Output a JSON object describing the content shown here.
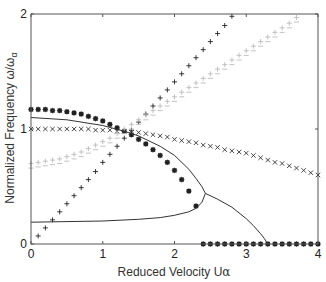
{
  "chart_data": {
    "type": "scatter",
    "title": "",
    "xlabel": "Reduced Velocity U",
    "xlabel_sub": "α",
    "ylabel": "Normalized Frequency ω/ω",
    "ylabel_sub": "α",
    "xlim": [
      0,
      4
    ],
    "ylim": [
      0,
      2
    ],
    "xticks": [
      0,
      1,
      2,
      3,
      4
    ],
    "yticks": [
      0,
      1,
      2
    ],
    "grid": false,
    "legend": null,
    "series": [
      {
        "name": "asterisk-markers",
        "marker": "asterisk",
        "color": "#222222",
        "x": [
          0,
          0.1,
          0.2,
          0.3,
          0.4,
          0.5,
          0.6,
          0.7,
          0.8,
          0.9,
          1.0,
          1.1,
          1.2,
          1.3,
          1.4,
          1.5,
          1.6,
          1.7,
          1.8,
          1.9,
          2.0,
          2.1,
          2.2,
          2.3
        ],
        "y": [
          1.17,
          1.17,
          1.17,
          1.16,
          1.16,
          1.15,
          1.14,
          1.13,
          1.11,
          1.09,
          1.07,
          1.04,
          1.01,
          0.98,
          0.95,
          0.91,
          0.87,
          0.82,
          0.77,
          0.71,
          0.64,
          0.56,
          0.46,
          0.33
        ]
      },
      {
        "name": "asterisk-markers-zero",
        "marker": "asterisk",
        "color": "#222222",
        "x": [
          2.4,
          2.5,
          2.6,
          2.7,
          2.8,
          2.9,
          3.0,
          3.1,
          3.2,
          3.3,
          3.4,
          3.5,
          3.6,
          3.7,
          3.8,
          3.9,
          4.0
        ],
        "y": [
          0,
          0,
          0,
          0,
          0,
          0,
          0,
          0,
          0,
          0,
          0,
          0,
          0,
          0,
          0,
          0,
          0
        ]
      },
      {
        "name": "cross-markers",
        "marker": "x",
        "color": "#333333",
        "x": [
          0,
          0.1,
          0.2,
          0.3,
          0.4,
          0.5,
          0.6,
          0.7,
          0.8,
          0.9,
          1.0,
          1.1,
          1.2,
          1.3,
          1.4,
          1.5,
          1.6,
          1.7,
          1.8,
          1.9,
          2.0,
          2.1,
          2.2,
          2.3,
          2.4,
          2.5,
          2.6,
          2.7,
          2.8,
          2.9,
          3.0,
          3.1,
          3.2,
          3.3,
          3.4,
          3.5,
          3.6,
          3.7,
          3.8,
          3.9,
          4.0
        ],
        "y": [
          1.0,
          1.0,
          1.0,
          1.0,
          1.0,
          1.0,
          1.0,
          1.0,
          1.0,
          0.99,
          0.99,
          0.99,
          0.98,
          0.98,
          0.97,
          0.97,
          0.96,
          0.95,
          0.94,
          0.93,
          0.91,
          0.9,
          0.89,
          0.88,
          0.86,
          0.85,
          0.84,
          0.82,
          0.81,
          0.8,
          0.79,
          0.77,
          0.75,
          0.73,
          0.71,
          0.7,
          0.68,
          0.66,
          0.64,
          0.62,
          0.6
        ]
      },
      {
        "name": "plus-markers",
        "marker": "plus",
        "color": "#222222",
        "x": [
          0.1,
          0.2,
          0.3,
          0.4,
          0.5,
          0.6,
          0.7,
          0.8,
          0.9,
          1.0,
          1.1,
          1.2,
          1.3,
          1.4,
          1.5,
          1.6,
          1.7,
          1.8,
          1.9,
          2.0,
          2.1,
          2.2,
          2.3,
          2.4,
          2.5,
          2.6,
          2.7,
          2.8
        ],
        "y": [
          0.07,
          0.14,
          0.21,
          0.28,
          0.35,
          0.42,
          0.49,
          0.56,
          0.63,
          0.71,
          0.78,
          0.85,
          0.92,
          0.99,
          1.06,
          1.13,
          1.2,
          1.27,
          1.34,
          1.41,
          1.48,
          1.55,
          1.62,
          1.69,
          1.76,
          1.83,
          1.9,
          1.98
        ]
      },
      {
        "name": "faint-plus-upper",
        "marker": "plus",
        "color": "#bbbbbb",
        "x": [
          0,
          0.1,
          0.2,
          0.3,
          0.4,
          0.5,
          0.6,
          0.7,
          0.8,
          0.9,
          1.0,
          1.1,
          1.2,
          1.3,
          1.4,
          1.5,
          1.6,
          1.7,
          1.8,
          1.9,
          2.0,
          2.1,
          2.2,
          2.3,
          2.4,
          2.5,
          2.6,
          2.7,
          2.8,
          2.9,
          3.0,
          3.1,
          3.2,
          3.3,
          3.4,
          3.5,
          3.6,
          3.7
        ],
        "y": [
          0.7,
          0.71,
          0.72,
          0.73,
          0.74,
          0.76,
          0.78,
          0.8,
          0.83,
          0.86,
          0.89,
          0.92,
          0.96,
          1.0,
          1.04,
          1.08,
          1.12,
          1.16,
          1.2,
          1.24,
          1.28,
          1.32,
          1.36,
          1.4,
          1.44,
          1.48,
          1.52,
          1.56,
          1.6,
          1.64,
          1.68,
          1.72,
          1.76,
          1.8,
          1.84,
          1.88,
          1.92,
          1.97
        ]
      },
      {
        "name": "faint-plus-lower",
        "marker": "minus",
        "color": "#bbbbbb",
        "x": [
          0,
          0.1,
          0.2,
          0.3,
          0.4,
          0.5,
          0.6,
          0.7,
          0.8,
          0.9,
          1.0,
          1.1,
          1.2,
          1.3,
          1.4,
          1.5,
          1.6,
          1.7,
          1.8,
          1.9,
          2.0,
          2.1,
          2.2,
          2.3,
          2.4,
          2.5,
          2.6,
          2.7,
          2.8,
          2.9,
          3.0,
          3.1,
          3.2,
          3.3,
          3.4,
          3.5,
          3.6,
          3.7
        ],
        "y": [
          0.66,
          0.67,
          0.68,
          0.69,
          0.7,
          0.72,
          0.74,
          0.76,
          0.79,
          0.82,
          0.85,
          0.88,
          0.92,
          0.96,
          1.0,
          1.04,
          1.08,
          1.12,
          1.16,
          1.2,
          1.24,
          1.28,
          1.32,
          1.36,
          1.4,
          1.44,
          1.48,
          1.52,
          1.56,
          1.6,
          1.64,
          1.68,
          1.72,
          1.76,
          1.8,
          1.84,
          1.88,
          1.93
        ]
      },
      {
        "name": "solid-curve-upper",
        "marker": "line",
        "color": "#333333",
        "x": [
          0,
          0.5,
          1.0,
          1.3,
          1.5,
          1.8,
          2.0,
          2.2,
          2.3,
          2.38,
          2.43
        ],
        "y": [
          1.1,
          1.08,
          1.03,
          0.98,
          0.94,
          0.85,
          0.77,
          0.65,
          0.57,
          0.5,
          0.44
        ]
      },
      {
        "name": "solid-curve-lower",
        "marker": "line",
        "color": "#333333",
        "x": [
          0,
          0.5,
          1.0,
          1.5,
          1.8,
          2.0,
          2.2,
          2.3,
          2.38,
          2.43
        ],
        "y": [
          0.19,
          0.195,
          0.2,
          0.215,
          0.23,
          0.25,
          0.28,
          0.31,
          0.36,
          0.44
        ]
      },
      {
        "name": "solid-curve-descending",
        "marker": "line",
        "color": "#333333",
        "x": [
          2.43,
          2.6,
          2.8,
          3.0,
          3.1,
          3.2,
          3.25,
          3.3
        ],
        "y": [
          0.44,
          0.39,
          0.32,
          0.22,
          0.16,
          0.09,
          0.05,
          0.0
        ]
      }
    ]
  }
}
